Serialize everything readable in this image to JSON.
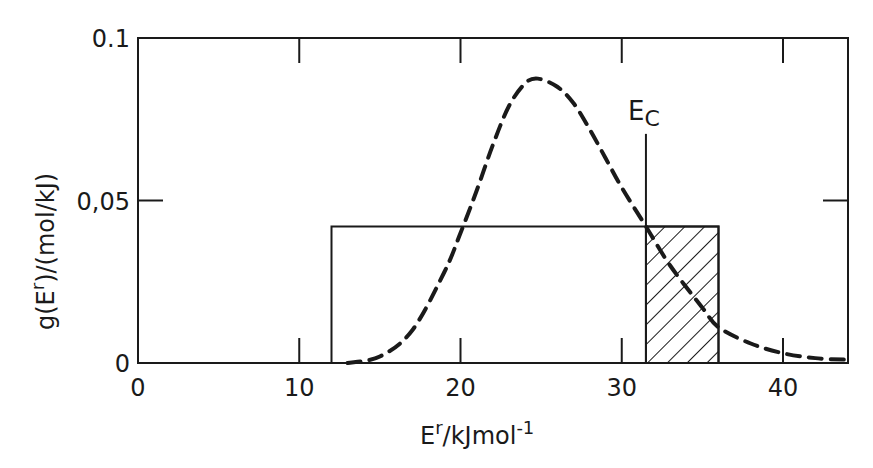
{
  "chart_data": {
    "type": "line",
    "title": "",
    "xlabel": "E^r/kJ mol^-1",
    "xlabel_parts": {
      "base": "E",
      "sup": "r",
      "rest": "/kJmol",
      "sup2": "-1"
    },
    "ylabel": "g(E^r)/(mol/kJ)",
    "ylabel_parts": {
      "pre": "g(E",
      "sup": "r",
      "post": ")/(mol/kJ)"
    },
    "xlim": [
      0,
      44
    ],
    "ylim": [
      0,
      0.1
    ],
    "x_ticks": [
      0,
      10,
      20,
      30,
      40
    ],
    "x_tick_labels": [
      "0",
      "10",
      "20",
      "30",
      "40"
    ],
    "y_ticks": [
      0,
      0.05,
      0.1
    ],
    "y_tick_labels": [
      "0",
      "0.05",
      "0.1"
    ],
    "grid": false,
    "series": [
      {
        "name": "g(E^r) distribution",
        "style": "dashed",
        "x": [
          13,
          15,
          17,
          19,
          20,
          21,
          22,
          23,
          24,
          24.8,
          26,
          27,
          28,
          29,
          30,
          31.5,
          33,
          35,
          36,
          38,
          40,
          42,
          44
        ],
        "values": [
          0.0,
          0.002,
          0.01,
          0.028,
          0.04,
          0.053,
          0.067,
          0.079,
          0.086,
          0.0875,
          0.085,
          0.08,
          0.072,
          0.063,
          0.054,
          0.042,
          0.03,
          0.017,
          0.011,
          0.006,
          0.003,
          0.0015,
          0.001
        ]
      },
      {
        "name": "rectangular distribution",
        "style": "solid",
        "x": [
          12,
          12,
          36,
          36
        ],
        "values": [
          0,
          0.042,
          0.042,
          0
        ]
      }
    ],
    "shaded_region": {
      "x_start": 31.5,
      "x_end": 36,
      "height": 0.042,
      "pattern": "hatched"
    },
    "annotations": [
      {
        "text": "E_C",
        "label_main": "E",
        "label_sub": "C",
        "x": 31.5,
        "type": "vertical-line",
        "line_top": 0.0705
      }
    ]
  }
}
